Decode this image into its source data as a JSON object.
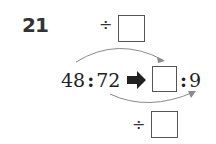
{
  "problem": {
    "number": "21",
    "top_operator": "÷",
    "bottom_operator": "÷",
    "left_ratio": {
      "a": "48",
      "sep": ":",
      "b": "72"
    },
    "right_ratio": {
      "a": "",
      "sep": ":",
      "b": "9"
    },
    "transform_arrow": "➡"
  },
  "colors": {
    "text": "#222222",
    "arc": "#888888",
    "box_border": "#555555"
  }
}
